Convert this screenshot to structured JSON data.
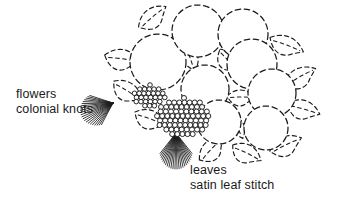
{
  "figure": {
    "kind": "embroidery-stitch-diagram",
    "background_color": "#ffffff",
    "ink_color": "#1a1a1a",
    "width": 343,
    "height": 199
  },
  "annotations": {
    "left": {
      "name": "flowers-annotation",
      "line1": "flowers",
      "line2": "colonial knots"
    },
    "bottom_right": {
      "name": "leaves-annotation",
      "line1": "leaves",
      "line2": "satin leaf stitch"
    }
  },
  "drawing": {
    "flowers": [
      {
        "cx": 158,
        "cy": 62,
        "r": 28
      },
      {
        "cx": 198,
        "cy": 31,
        "r": 26
      },
      {
        "cx": 243,
        "cy": 34,
        "r": 25
      },
      {
        "cx": 252,
        "cy": 64,
        "r": 25
      },
      {
        "cx": 205,
        "cy": 89,
        "r": 24
      },
      {
        "cx": 272,
        "cy": 93,
        "r": 24
      },
      {
        "cx": 219,
        "cy": 122,
        "r": 22
      },
      {
        "cx": 266,
        "cy": 128,
        "r": 22
      }
    ],
    "leaves": [
      {
        "cx": 153,
        "cy": 18,
        "rx": 17,
        "ry": 12,
        "rot": -32
      },
      {
        "cx": 122,
        "cy": 60,
        "rx": 18,
        "ry": 13,
        "rot": 16
      },
      {
        "cx": 127,
        "cy": 92,
        "rx": 17,
        "ry": 12,
        "rot": 40
      },
      {
        "cx": 189,
        "cy": 58,
        "rx": 14,
        "ry": 11,
        "rot": 78
      },
      {
        "cx": 228,
        "cy": 62,
        "rx": 15,
        "ry": 11,
        "rot": 58
      },
      {
        "cx": 286,
        "cy": 46,
        "rx": 18,
        "ry": 12,
        "rot": 28
      },
      {
        "cx": 300,
        "cy": 78,
        "rx": 18,
        "ry": 12,
        "rot": -22
      },
      {
        "cx": 303,
        "cy": 110,
        "rx": 17,
        "ry": 12,
        "rot": 24
      },
      {
        "cx": 241,
        "cy": 98,
        "rx": 14,
        "ry": 10,
        "rot": 8
      },
      {
        "cx": 150,
        "cy": 120,
        "rx": 17,
        "ry": 12,
        "rot": 28
      },
      {
        "cx": 212,
        "cy": 150,
        "rx": 16,
        "ry": 12,
        "rot": -38
      },
      {
        "cx": 246,
        "cy": 154,
        "rx": 16,
        "ry": 12,
        "rot": 34
      },
      {
        "cx": 286,
        "cy": 146,
        "rx": 17,
        "ry": 12,
        "rot": -18
      },
      {
        "cx": 236,
        "cy": 127,
        "rx": 13,
        "ry": 10,
        "rot": 70
      }
    ],
    "knot_clusters": [
      {
        "name": "small-knot-cluster",
        "cx": 150,
        "cy": 96,
        "rx": 16,
        "ry": 11,
        "dot_r": 2.3
      },
      {
        "name": "large-knot-cluster",
        "cx": 184,
        "cy": 117,
        "rx": 27,
        "ry": 19,
        "dot_r": 2.5
      }
    ],
    "satin_fans": [
      {
        "name": "left-satin-fan",
        "ox": 113,
        "oy": 103,
        "spread_from": -18,
        "spread_to": 62,
        "len": 34,
        "count": 22
      },
      {
        "name": "bottom-satin-fan",
        "ox": 176,
        "oy": 133,
        "spread_from": 52,
        "spread_to": 128,
        "len": 36,
        "count": 24
      }
    ]
  }
}
